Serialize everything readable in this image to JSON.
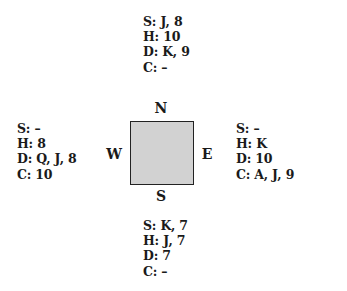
{
  "diagram": {
    "type": "bridge-deal",
    "table": {
      "fill_color": "#d2d2d2",
      "border_color": "#222222"
    },
    "compass": {
      "north": "N",
      "south": "S",
      "west": "W",
      "east": "E"
    }
  },
  "hands": {
    "north": {
      "spades": "S: J, 8",
      "hearts": "H: 10",
      "diamonds": "D: K, 9",
      "clubs": "C: –"
    },
    "west": {
      "spades": "S: –",
      "hearts": "H: 8",
      "diamonds": "D: Q, J, 8",
      "clubs": "C: 10"
    },
    "east": {
      "spades": "S: –",
      "hearts": "H: K",
      "diamonds": "D: 10",
      "clubs": "C: A, J, 9"
    },
    "south": {
      "spades": "S: K, 7",
      "hearts": "H: J, 7",
      "diamonds": "D: 7",
      "clubs": "C: –"
    }
  }
}
